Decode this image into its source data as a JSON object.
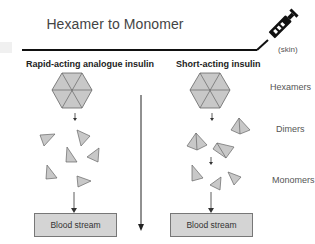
{
  "title": "Hexamer to Monomer",
  "skin_label": "(skin)",
  "columns": [
    {
      "heading": "Rapid-acting analogue insulin",
      "box_label": "Blood stream"
    },
    {
      "heading": "Short-acting insulin",
      "box_label": "Blood stream"
    }
  ],
  "row_labels": {
    "hexamers": "Hexamers",
    "dimers": "Dimers",
    "monomers": "Monomers"
  },
  "icons": {
    "syringe": "syringe-icon",
    "hexamer": "hexagon",
    "dimer": "pyramid",
    "monomer": "triangle"
  },
  "colors": {
    "shape_fill": "#c8c8c8",
    "shape_stroke": "#555555",
    "box_fill": "#d4d4d4",
    "line": "#111111"
  }
}
